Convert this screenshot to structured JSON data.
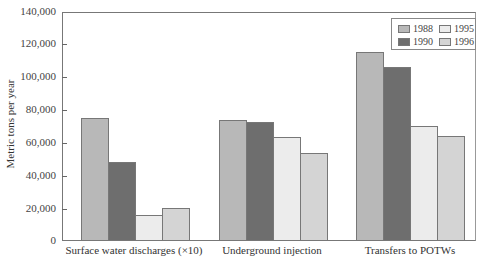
{
  "chart_data": {
    "type": "bar",
    "title": "",
    "xlabel": "",
    "ylabel": "Metric tons per year",
    "ylim": [
      0,
      140000
    ],
    "yticks": [
      "0",
      "20,000",
      "40,000",
      "60,000",
      "80,000",
      "100,000",
      "120,000",
      "140,000"
    ],
    "categories": [
      "Surface water discharges (×10)",
      "Underground injection",
      "Transfers to POTWs"
    ],
    "series": [
      {
        "name": "1988",
        "color": "#b8b8b8",
        "values": [
          75000,
          74000,
          115500
        ]
      },
      {
        "name": "1990",
        "color": "#6e6e6e",
        "values": [
          48300,
          72700,
          106400
        ]
      },
      {
        "name": "1995",
        "color": "#ececec",
        "values": [
          16000,
          63600,
          70300
        ]
      },
      {
        "name": "1996",
        "color": "#d4d4d4",
        "values": [
          20200,
          53800,
          64200
        ]
      }
    ],
    "legend_position": "top-right",
    "grid": false
  }
}
